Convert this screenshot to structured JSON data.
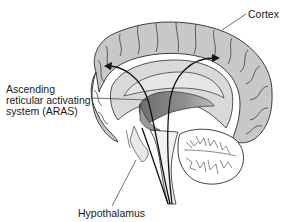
{
  "figure": {
    "type": "anatomical-diagram",
    "labels": {
      "cortex": "Cortex",
      "aras_line1": "Ascending",
      "aras_line2": "reticular activating",
      "aras_line3": "system (ARAS)",
      "hypothalamus": "Hypothalamus"
    },
    "colors": {
      "cortex_fill": "#c8c8c8",
      "inner_fill": "#d4d4d4",
      "thalamus_shade": "#8a8a8a",
      "outline": "#2a2a2a",
      "arrow": "#111111",
      "background": "#ffffff"
    }
  }
}
